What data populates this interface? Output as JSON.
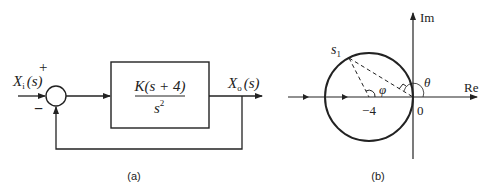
{
  "figure_a": {
    "caption": "(a)",
    "input_label_main": "X",
    "input_label_sub": "i",
    "input_label_arg": "(s)",
    "plus_sign": "+",
    "minus_sign": "−",
    "transfer_numerator": "K(s + 4)",
    "transfer_denominator_base": "s",
    "transfer_denominator_exp": "2",
    "output_label_main": "X",
    "output_label_sub": "o",
    "output_label_arg": "(s)"
  },
  "figure_b": {
    "caption": "(b)",
    "im_axis_label": "Im",
    "re_axis_label": "Re",
    "origin_label": "0",
    "pole_zero_label": "−4",
    "point_label_main": "s",
    "point_label_sub": "1",
    "angle_phi": "φ",
    "angle_theta": "θ"
  },
  "colors": {
    "stroke": "#222222",
    "background": "#ffffff"
  }
}
